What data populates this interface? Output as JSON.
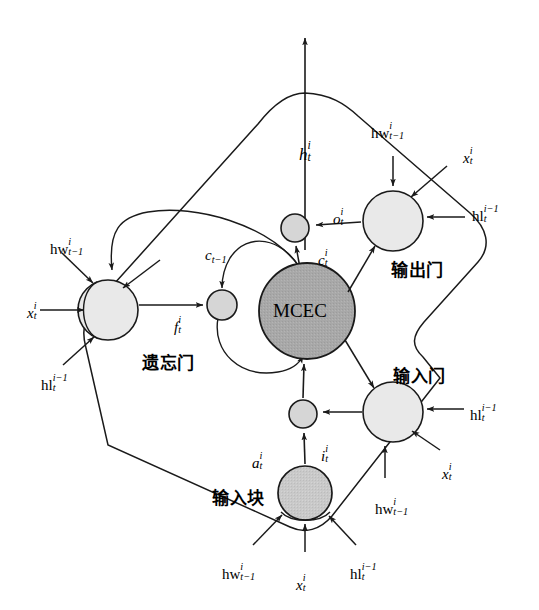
{
  "diagram": {
    "background": "#ffffff",
    "stroke": "#1a1a1a",
    "colors": {
      "gate_fill": "#e9e9e9",
      "mcec_fill": "#a8a8a8",
      "mult_fill": "#d6d6d6",
      "block_fill": "#c9c9c9",
      "line": "#1a1a1a"
    }
  },
  "nodes": {
    "mcec": {
      "label": "MCEC",
      "cx": 307,
      "cy": 311,
      "r": 48
    },
    "forget_gate": {
      "label": "遗忘门",
      "cx": 108,
      "cy": 310,
      "r": 30
    },
    "output_gate": {
      "label": "输出门",
      "cx": 393,
      "cy": 221,
      "r": 30
    },
    "input_gate": {
      "label": "输入门",
      "cx": 393,
      "cy": 412,
      "r": 30
    },
    "input_block": {
      "label": "输入块",
      "cx": 305,
      "cy": 493,
      "r": 27
    },
    "mult_top": {
      "cx": 295,
      "cy": 228,
      "r": 14
    },
    "mult_left": {
      "cx": 222,
      "cy": 305,
      "r": 15
    },
    "mult_bottom": {
      "cx": 303,
      "cy": 414,
      "r": 14
    }
  },
  "gate_labels": {
    "forget": "遗忘门",
    "output": "输出门",
    "input": "输入门",
    "block": "输入块",
    "mcec": "MCEC"
  },
  "signals": {
    "h_out": {
      "base": "h",
      "sub": "t",
      "sup": "i"
    },
    "c_t": {
      "base": "c",
      "sub": "t",
      "sup": "i"
    },
    "c_prev": {
      "base": "c",
      "sub": "t−1",
      "sup": ""
    },
    "f_t": {
      "base": "f",
      "sub": "t",
      "sup": "i"
    },
    "o_t": {
      "base": "o",
      "sub": "t",
      "sup": "i"
    },
    "i_t": {
      "base": "i",
      "sub": "t",
      "sup": "i"
    },
    "a_t": {
      "base": "a",
      "sub": "t",
      "sup": "i"
    },
    "x_t": {
      "base": "x",
      "sub": "t",
      "sup": "i"
    },
    "hw": {
      "base": "hw",
      "sub": "t−1",
      "sup": "i"
    },
    "hl": {
      "base": "hl",
      "sub": "t",
      "sup": "i−1"
    }
  },
  "labels": [
    {
      "name": "h-output-label",
      "base": "h",
      "sub": "t",
      "sup": "i",
      "x": 299,
      "y": 140,
      "size": 17
    },
    {
      "name": "output-gate-hw-label",
      "base": "hw",
      "sub": "t−1",
      "sup": "i",
      "x": 371,
      "y": 121,
      "size": 15
    },
    {
      "name": "output-gate-x-label",
      "base": "x",
      "sub": "t",
      "sup": "i",
      "x": 463,
      "y": 146,
      "size": 15
    },
    {
      "name": "output-gate-hl-label",
      "base": "hl",
      "sub": "t",
      "sup": "i−1",
      "x": 472,
      "y": 204,
      "size": 15
    },
    {
      "name": "o-t-label",
      "base": "o",
      "sub": "t",
      "sup": "i",
      "x": 333,
      "y": 207,
      "size": 15
    },
    {
      "name": "c-t-label",
      "base": "c",
      "sub": "t",
      "sup": "i",
      "x": 318,
      "y": 248,
      "size": 15
    },
    {
      "name": "c-prev-label",
      "base": "c",
      "sub": "t−1",
      "sup": "",
      "x": 205,
      "y": 248,
      "size": 15
    },
    {
      "name": "forget-gate-hw-label",
      "base": "hw",
      "sub": "t−1",
      "sup": "i",
      "x": 50,
      "y": 237,
      "size": 15
    },
    {
      "name": "forget-gate-x-label",
      "base": "x",
      "sub": "t",
      "sup": "i",
      "x": 27,
      "y": 301,
      "size": 15
    },
    {
      "name": "forget-gate-hl-label",
      "base": "hl",
      "sub": "t",
      "sup": "i−1",
      "x": 41,
      "y": 373,
      "size": 15
    },
    {
      "name": "f-t-label",
      "base": "f",
      "sub": "t",
      "sup": "i",
      "x": 174,
      "y": 315,
      "size": 15
    },
    {
      "name": "i-t-label",
      "base": "i",
      "sub": "t",
      "sup": "i",
      "x": 321,
      "y": 444,
      "size": 15
    },
    {
      "name": "a-t-label",
      "base": "a",
      "sub": "t",
      "sup": "i",
      "x": 252,
      "y": 451,
      "size": 15
    },
    {
      "name": "input-gate-hl-label",
      "base": "hl",
      "sub": "t",
      "sup": "i−1",
      "x": 470,
      "y": 403,
      "size": 15
    },
    {
      "name": "input-gate-x-label",
      "base": "x",
      "sub": "t",
      "sup": "i",
      "x": 442,
      "y": 462,
      "size": 15
    },
    {
      "name": "input-gate-hw-label",
      "base": "hw",
      "sub": "t−1",
      "sup": "i",
      "x": 375,
      "y": 497,
      "size": 15
    },
    {
      "name": "input-block-hw-label",
      "base": "hw",
      "sub": "t−1",
      "sup": "i",
      "x": 222,
      "y": 562,
      "size": 15
    },
    {
      "name": "input-block-x-label",
      "base": "x",
      "sub": "t",
      "sup": "i",
      "x": 296,
      "y": 573,
      "size": 15
    },
    {
      "name": "input-block-hl-label",
      "base": "hl",
      "sub": "t",
      "sup": "i−1",
      "x": 350,
      "y": 562,
      "size": 15
    }
  ],
  "cn_labels": [
    {
      "name": "forget-gate-name",
      "text": "遗忘门",
      "x": 142,
      "y": 355
    },
    {
      "name": "output-gate-name",
      "text": "输出门",
      "x": 391,
      "y": 262
    },
    {
      "name": "input-gate-name",
      "text": "输入门",
      "x": 393,
      "y": 368
    },
    {
      "name": "input-block-name",
      "text": "输入块",
      "x": 212,
      "y": 490
    }
  ]
}
